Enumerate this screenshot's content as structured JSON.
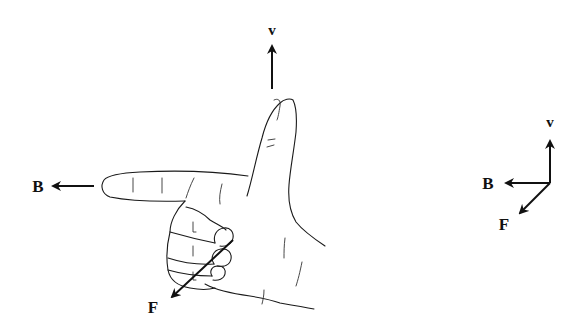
{
  "figure": {
    "hand_labels": {
      "velocity": "v",
      "field": "B",
      "force": "F"
    },
    "axes_labels": {
      "velocity": "v",
      "field": "B",
      "force": "F"
    },
    "vectors": [
      {
        "name": "v",
        "meaning": "velocity",
        "direction": "up"
      },
      {
        "name": "B",
        "meaning": "magnetic field",
        "direction": "left"
      },
      {
        "name": "F",
        "meaning": "force",
        "direction": "down-left (out of page)"
      }
    ],
    "colors": {
      "ink": "#111111",
      "background": "#ffffff"
    }
  }
}
